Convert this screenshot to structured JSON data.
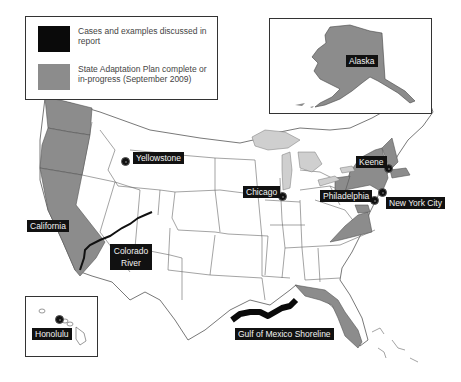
{
  "legend": {
    "items": [
      {
        "label": "Cases and examples discussed in report",
        "color": "#0a0a0a"
      },
      {
        "label": "State Adaptation Plan complete or in-progress (September 2009)",
        "color": "#8c8c8c"
      }
    ]
  },
  "colors": {
    "case": "#0a0a0a",
    "adaptation_state": "#8c8c8c",
    "great_lakes": "#cfcfcf",
    "state_border": "#555555",
    "background": "#ffffff"
  },
  "insets": {
    "alaska": {
      "label": "Alaska"
    },
    "hawaii": {
      "label": "Honolulu"
    }
  },
  "places": [
    {
      "id": "yellowstone",
      "label": "Yellowstone"
    },
    {
      "id": "chicago",
      "label": "Chicago"
    },
    {
      "id": "keene",
      "label": "Keene"
    },
    {
      "id": "philadelphia",
      "label": "Philadelphia"
    },
    {
      "id": "new-york-city",
      "label": "New York City"
    },
    {
      "id": "california",
      "label": "California"
    },
    {
      "id": "colorado-river",
      "label": "Colorado River"
    },
    {
      "id": "gulf-of-mexico",
      "label": "Gulf of Mexico Shoreline"
    }
  ],
  "adaptation_states": [
    "Washington",
    "Oregon",
    "California",
    "Alaska",
    "New York",
    "New Hampshire",
    "Maryland",
    "Virginia",
    "Florida",
    "Massachusetts",
    "Connecticut",
    "Pennsylvania"
  ]
}
